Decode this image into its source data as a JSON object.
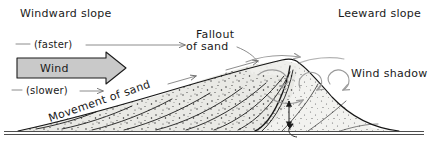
{
  "figure": {
    "background_color": "#ffffff",
    "width": 429,
    "height": 147
  },
  "labels": {
    "windward_slope": "Windward slope",
    "leeward_slope": "Leeward slope",
    "fallout_line1": "Fallout",
    "fallout_line2": "of sand",
    "wind_shadow": "Wind shadow",
    "faster": "(faster)",
    "slower": "(slower)",
    "wind": "Wind",
    "movement_of_sand": "Movement of sand"
  },
  "colors": {
    "ink": "#141414",
    "text": "#1a1a1a",
    "wind_arrow_fill": "#c9c9c9",
    "wind_arrow_stroke": "#1a1a1a",
    "sand_fill": "#e8e8e4",
    "sand_speckle": "#333333",
    "swirl_arrow": "#9a9a9a",
    "thin_arrow": "#6e6e6e",
    "ground_line": "#3a3a3a",
    "lee_fill": "#f2f2f0"
  },
  "icons": {
    "wind_block_arrow": "block-arrow-right-icon",
    "faster_arrow": "arrow-right-icon",
    "slower_arrow": "arrow-right-icon",
    "movement_arrow": "arrow-right-icon",
    "fallout_pointer": "curve-pointer-icon",
    "eddy_swirls": "swirl-arrow-icon",
    "slipface_height_arrow": "double-headed-arrow-icon",
    "avalanche_arrow": "curved-arrow-icon"
  }
}
